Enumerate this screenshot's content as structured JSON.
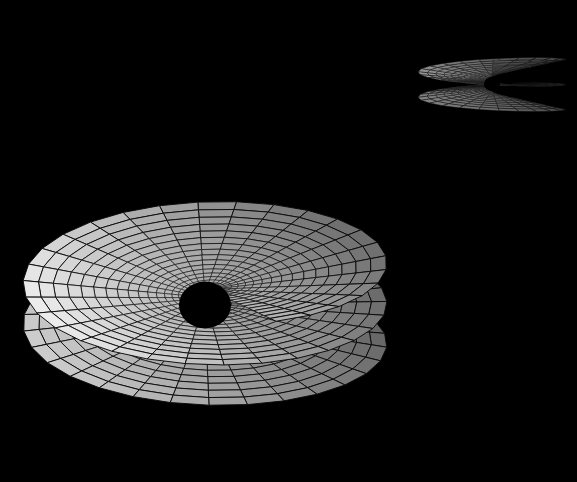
{
  "canvas": {
    "width": 577,
    "height": 482,
    "background_color": "#000000",
    "title": "",
    "axes_visible": false,
    "grid_visible": false,
    "legend_visible": false,
    "labels_visible": false
  },
  "chart_data": {
    "type": "surface",
    "title": "",
    "subtitle": "",
    "xlabel": "",
    "ylabel": "",
    "zlabel": "",
    "render_style": "shaded-mesh-wireframe",
    "mesh_line_color": "#0a0a0a",
    "background": "#000000",
    "shading": "grayscale-lambertian",
    "grayscale_range": [
      "#2e2e2e",
      "#f2f2f2"
    ],
    "surfaces": [
      {
        "name": "main-riemann-surface",
        "role": "primary",
        "center_x": 205,
        "center_y": 305,
        "bbox": [
          8,
          166,
          382,
          458
        ],
        "outer_radius_x": 182,
        "outer_radius_y": 152,
        "sheets": 2.45,
        "ramp_turns": 2.45,
        "radial_divisions": 22,
        "angular_divisions": 72,
        "spiral_tightness": 0.155,
        "tilt_deg": 62,
        "rotation_deg": -14,
        "ramp_height": 112,
        "highlight_color": "#f2f2f2",
        "shadow_color": "#2e2e2e",
        "mid_color": "#8c8c8c",
        "singularity_color": "#000000",
        "singularity_radius": 26
      },
      {
        "name": "secondary-riemann-surface",
        "role": "inset",
        "center_x": 492,
        "center_y": 84,
        "bbox": [
          420,
          18,
          572,
          152
        ],
        "outer_radius_x": 74,
        "outer_radius_y": 66,
        "sheets": 2.45,
        "ramp_turns": 2.45,
        "radial_divisions": 15,
        "angular_divisions": 56,
        "spiral_tightness": 0.155,
        "tilt_deg": 84,
        "rotation_deg": 8,
        "ramp_height": 62,
        "highlight_color": "#9a9a9a",
        "shadow_color": "#232323",
        "mid_color": "#5e5e5e",
        "singularity_color": "#000000",
        "singularity_radius": 8
      }
    ],
    "value_legend": {
      "min_shade": "#2e2e2e",
      "max_shade": "#f2f2f2",
      "units": "relative surface normal illumination"
    }
  },
  "surface_shading_samples": {
    "upper_sheet_underside": "#6b6b6b",
    "left_lobe": "#4a4a4a",
    "right_lobe": "#b8b8b8",
    "lower_lobe": "#a8a8a8",
    "ramp_edge_highlight": "#ececec",
    "deep_center": "#050505",
    "inset_left_lobe": "#6e6e6e",
    "inset_right_lobe": "#4b4b4b"
  },
  "accessibility": {
    "alt_text": "Grayscale 3D wireframe rendering of a spiral Riemann surface with a second smaller view in the upper right corner, on a black background."
  }
}
